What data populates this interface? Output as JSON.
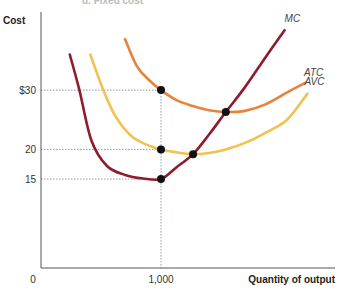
{
  "caption_fragment": "d. Fixed cost",
  "chart_data": {
    "type": "line",
    "title": "",
    "xlabel": "Quantity of output",
    "ylabel": "Cost",
    "xlim": [
      0,
      2300
    ],
    "ylim": [
      0,
      40
    ],
    "grid": false,
    "x_ticks": [
      {
        "value": 0,
        "label": "0"
      },
      {
        "value": 1000,
        "label": "1,000"
      }
    ],
    "y_ticks": [
      {
        "value": 30,
        "label": "$30"
      },
      {
        "value": 20,
        "label": "20"
      },
      {
        "value": 15,
        "label": "15"
      }
    ],
    "reference_lines": [
      {
        "type": "horizontal",
        "y": 30,
        "x_to": 1000
      },
      {
        "type": "horizontal",
        "y": 20,
        "x_to": 1000
      },
      {
        "type": "horizontal",
        "y": 15,
        "x_to": 1000
      },
      {
        "type": "vertical",
        "x": 1000,
        "y_to": 30
      }
    ],
    "series": [
      {
        "name": "MC",
        "color": "#8c1c2e",
        "x": [
          240,
          320,
          420,
          550,
          700,
          850,
          1000,
          1130,
          1267,
          1400,
          1540,
          1700,
          1870,
          2030
        ],
        "y": [
          36,
          30,
          21.5,
          17.2,
          15.7,
          15.1,
          15,
          17,
          19.2,
          22.5,
          26.3,
          30.5,
          35.5,
          40.1
        ]
      },
      {
        "name": "ATC",
        "color": "#e8823c",
        "x": [
          700,
          800,
          900,
          1000,
          1130,
          1267,
          1400,
          1540,
          1700,
          1870,
          2040,
          2200
        ],
        "y": [
          38.6,
          34,
          31.7,
          30,
          28.3,
          27.3,
          26.6,
          26.3,
          26.5,
          27.6,
          29.5,
          31.2
        ]
      },
      {
        "name": "AVC",
        "color": "#f2c14e",
        "x": [
          410,
          520,
          620,
          750,
          880,
          1000,
          1130,
          1267,
          1400,
          1540,
          1700,
          1870,
          2050,
          2220
        ],
        "y": [
          36,
          30,
          25.6,
          22.3,
          20.8,
          20,
          19.5,
          19.2,
          19.4,
          20,
          21.1,
          22.8,
          25,
          29.4
        ]
      }
    ],
    "highlighted_points": [
      {
        "x": 1000,
        "y": 30,
        "on": "ATC"
      },
      {
        "x": 1000,
        "y": 20,
        "on": "AVC"
      },
      {
        "x": 1000,
        "y": 15,
        "on": "MC"
      },
      {
        "x": 1267,
        "y": 19.2,
        "on": "MC-AVC intersection"
      },
      {
        "x": 1540,
        "y": 26.3,
        "on": "MC-ATC intersection"
      }
    ],
    "annotations": [
      "MC",
      "ATC",
      "AVC"
    ]
  }
}
